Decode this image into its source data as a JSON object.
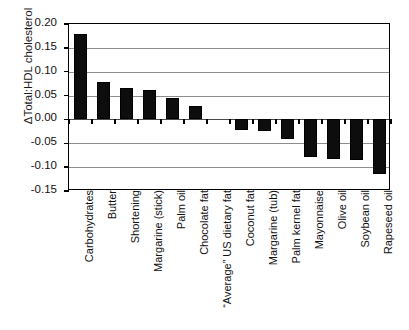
{
  "chart_data": {
    "type": "bar",
    "title": "",
    "subtitle": "",
    "xlabel": "",
    "ylabel": "ΔTotal:HDL cholesterol",
    "ylim": [
      -0.15,
      0.2
    ],
    "ytick_labels": [
      "0.20",
      "0.15",
      "0.10",
      "0.05",
      "0.00",
      "-0.05",
      "-0.10",
      "-0.15"
    ],
    "ytick_values": [
      0.2,
      0.15,
      0.1,
      0.05,
      0.0,
      -0.05,
      -0.1,
      -0.15
    ],
    "grid": true,
    "grid_axis": "y",
    "legend": false,
    "legend_position": "none",
    "bar_color": "#0d0d0d",
    "categories": [
      "Carbohydrates",
      "Butter",
      "Shortening",
      "Margarine (stick)",
      "Palm oil",
      "Chocolate fat",
      "“Average” US dietary fat",
      "Coconut fat",
      "Margarine (tub)",
      "Palm kernel fat",
      "Mayonnaise",
      "Olive oil",
      "Soybean oil",
      "Rapeseed oil"
    ],
    "values": [
      0.178,
      0.078,
      0.065,
      0.062,
      0.044,
      0.028,
      0.0,
      -0.022,
      -0.025,
      -0.04,
      -0.078,
      -0.082,
      -0.085,
      -0.115
    ]
  }
}
